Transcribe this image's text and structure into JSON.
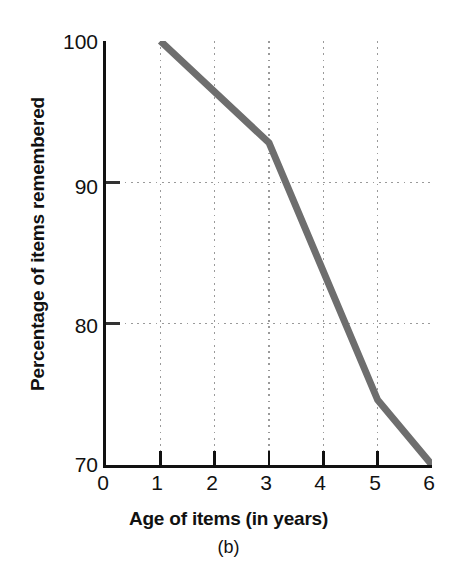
{
  "chart_data": {
    "type": "line",
    "title": "",
    "panel_label": "(b)",
    "xlabel": "Age of items (in years)",
    "ylabel": "Percentage of items remembered",
    "xlim": [
      0,
      6
    ],
    "ylim": [
      70,
      100
    ],
    "xticks": [
      "0",
      "1",
      "2",
      "3",
      "4",
      "5",
      "6"
    ],
    "xtick_values": [
      0,
      1,
      2,
      3,
      4,
      5,
      6
    ],
    "yticks": [
      "70",
      "80",
      "90",
      "100"
    ],
    "ytick_values": [
      70,
      80,
      90,
      100
    ],
    "grid": "dotted gridlines at x = 1,2,3,4,5 and y = 80,90",
    "legend": "none",
    "series": [
      {
        "name": "Percentage of items remembered",
        "color": "#6e6e6e",
        "line_width": 7,
        "x": [
          1,
          3,
          5,
          6
        ],
        "values": [
          100,
          92.8,
          74.6,
          70
        ]
      }
    ]
  },
  "axes": {
    "y_label_text": "Percentage of items remembered",
    "x_label_text": "Age of items (in years)",
    "caption_text": "(b)",
    "y_tick_labels": [
      "100",
      "90",
      "80",
      "70"
    ],
    "x_tick_labels": [
      "0",
      "1",
      "2",
      "3",
      "4",
      "5",
      "6"
    ]
  },
  "colors": {
    "line": "#6e6e6e",
    "axis": "#111111",
    "grid": "#9a9a9a",
    "background": "#ffffff",
    "text": "#111111"
  }
}
